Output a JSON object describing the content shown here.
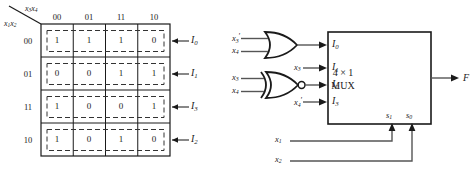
{
  "figure": {
    "kmap": {
      "col_axis_label": "x3x4",
      "row_axis_label": "x1x2",
      "col_headers": [
        "00",
        "01",
        "11",
        "10"
      ],
      "row_headers": [
        "00",
        "01",
        "11",
        "10"
      ],
      "rows": [
        {
          "header": "00",
          "values": [
            "1",
            "1",
            "1",
            "0"
          ],
          "mux_input": "I0"
        },
        {
          "header": "01",
          "values": [
            "0",
            "0",
            "1",
            "1"
          ],
          "mux_input": "I1"
        },
        {
          "header": "11",
          "values": [
            "1",
            "0",
            "0",
            "1"
          ],
          "mux_input": "I3"
        },
        {
          "header": "10",
          "values": [
            "1",
            "0",
            "1",
            "0"
          ],
          "mux_input": "I2"
        }
      ]
    },
    "circuit": {
      "mux_label_line1": "4 × 1",
      "mux_label_line2": "MUX",
      "data_inputs": [
        "I0",
        "I1",
        "I2",
        "I3"
      ],
      "select_inputs": [
        "s1",
        "s0"
      ],
      "output": "F",
      "or_gate": {
        "type": "or-gate",
        "inputs": [
          "x3'",
          "x4"
        ],
        "feeds": "I0"
      },
      "nor_gate": {
        "type": "nor-gate",
        "inputs": [
          "x3",
          "x4"
        ],
        "feeds": "I2"
      },
      "direct_inputs": [
        {
          "signal": "x3",
          "feeds": "I1"
        },
        {
          "signal": "x4'",
          "feeds": "I3"
        }
      ],
      "select_sources": [
        {
          "signal": "x1",
          "feeds": "s1"
        },
        {
          "signal": "x2",
          "feeds": "s0"
        }
      ]
    },
    "colors": {
      "line": "#1a1a1a",
      "dashed": "#333333",
      "background": "#ffffff"
    }
  }
}
